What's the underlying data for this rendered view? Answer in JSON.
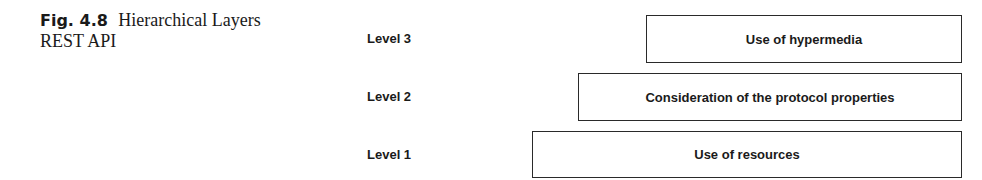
{
  "caption": {
    "fig_label": "Fig. 4.8",
    "title_line1": "Hierarchical Layers",
    "title_line2": "REST API"
  },
  "levels": [
    {
      "label": "Level 3",
      "box_text": "Use of hypermedia"
    },
    {
      "label": "Level 2",
      "box_text": "Consideration of the protocol properties"
    },
    {
      "label": "Level 1",
      "box_text": "Use of resources"
    }
  ]
}
